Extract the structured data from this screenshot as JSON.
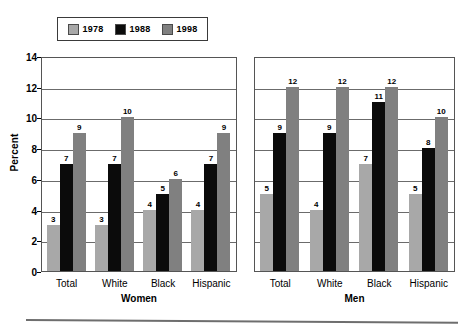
{
  "chart_data": {
    "type": "bar",
    "title": "",
    "xlabel": "",
    "ylabel": "Percent",
    "ylim": [
      0,
      14
    ],
    "yticks": [
      0,
      2,
      4,
      6,
      8,
      10,
      12,
      14
    ],
    "grid": true,
    "legend_position": "top-left",
    "legend": [
      "1978",
      "1988",
      "1998"
    ],
    "series": [
      {
        "name": "1978",
        "color": "#a8a8a8"
      },
      {
        "name": "1988",
        "color": "#0b0b0b"
      },
      {
        "name": "1998",
        "color": "#808080"
      }
    ],
    "panels": [
      {
        "name": "Women",
        "categories": [
          "Total",
          "White",
          "Black",
          "Hispanic"
        ],
        "series": [
          {
            "name": "1978",
            "values": [
              3,
              3,
              4,
              4
            ]
          },
          {
            "name": "1988",
            "values": [
              7,
              7,
              5,
              7
            ]
          },
          {
            "name": "1998",
            "values": [
              9,
              10,
              6,
              9
            ]
          }
        ]
      },
      {
        "name": "Men",
        "categories": [
          "Total",
          "White",
          "Black",
          "Hispanic"
        ],
        "series": [
          {
            "name": "1978",
            "values": [
              5,
              4,
              7,
              5
            ]
          },
          {
            "name": "1988",
            "values": [
              9,
              9,
              11,
              8
            ]
          },
          {
            "name": "1998",
            "values": [
              12,
              12,
              12,
              10
            ]
          }
        ]
      }
    ]
  },
  "legend": {
    "items": [
      {
        "label": "1978",
        "color": "#a8a8a8"
      },
      {
        "label": "1988",
        "color": "#0b0b0b"
      },
      {
        "label": "1998",
        "color": "#808080"
      }
    ]
  },
  "axis": {
    "y_title": "Percent",
    "y_ticks": [
      "14",
      "12",
      "10",
      "8",
      "6",
      "4",
      "2",
      "0"
    ]
  },
  "panels": {
    "women": {
      "title": "Women",
      "categories": [
        "Total",
        "White",
        "Black",
        "Hispanic"
      ],
      "bar_labels": [
        [
          "3",
          "7",
          "9"
        ],
        [
          "3",
          "7",
          "10"
        ],
        [
          "4",
          "5",
          "6"
        ],
        [
          "4",
          "7",
          "9"
        ]
      ]
    },
    "men": {
      "title": "Men",
      "categories": [
        "Total",
        "White",
        "Black",
        "Hispanic"
      ],
      "bar_labels": [
        [
          "5",
          "9",
          "12"
        ],
        [
          "4",
          "9",
          "12"
        ],
        [
          "7",
          "11",
          "12"
        ],
        [
          "5",
          "8",
          "10"
        ]
      ]
    }
  }
}
